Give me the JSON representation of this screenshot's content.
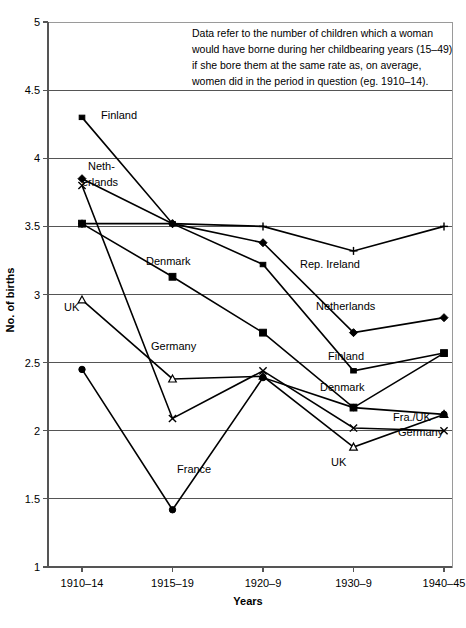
{
  "chart_data": {
    "type": "line",
    "title": "",
    "xlabel": "Years",
    "ylabel": "No. of births",
    "categories": [
      "1910–14",
      "1915–19",
      "1920–9",
      "1930–9",
      "1940–45"
    ],
    "ylim": [
      1,
      5
    ],
    "ytick_labels": [
      "1",
      "1.5",
      "2",
      "2.5",
      "3",
      "3.5",
      "4",
      "4.5",
      "5"
    ],
    "ytick_values": [
      1,
      1.5,
      2,
      2.5,
      3,
      3.5,
      4,
      4.5,
      5
    ],
    "grid": "horizontal",
    "legend": "inline-labels",
    "annotation": {
      "lines": [
        "Data refer to the number of children which a woman",
        "would have borne during her childbearing years (15–49)",
        "if she bore them at the same rate as, on average,",
        "women did in the period in question (eg. 1910–14)."
      ]
    },
    "series": [
      {
        "name": "Finland",
        "marker": "square-small",
        "values": [
          4.3,
          3.52,
          3.22,
          2.44,
          2.57
        ],
        "start_label": "Finland",
        "end_label": "Finland"
      },
      {
        "name": "Netherlands",
        "marker": "diamond",
        "values": [
          3.85,
          3.52,
          3.38,
          2.72,
          2.83
        ],
        "start_label": "Neth-\u000berlands",
        "end_label": "Netherlands"
      },
      {
        "name": "Rep. Ireland",
        "marker": "plus",
        "values": [
          3.52,
          3.52,
          3.5,
          3.32,
          3.5
        ],
        "start_label": "",
        "end_label": "Rep. Ireland"
      },
      {
        "name": "Denmark",
        "marker": "square",
        "values": [
          3.52,
          3.13,
          2.72,
          2.17,
          2.57
        ],
        "start_label": "Denmark",
        "end_label": "Denmark"
      },
      {
        "name": "UK",
        "marker": "triangle",
        "values": [
          2.96,
          2.38,
          2.4,
          1.88,
          2.12
        ],
        "start_label": "UK",
        "end_label": "Fra./UK"
      },
      {
        "name": "Germany",
        "marker": "x",
        "values": [
          3.8,
          2.09,
          2.44,
          2.02,
          2.0
        ],
        "start_label": "Germany",
        "end_label": "Germany"
      },
      {
        "name": "France",
        "marker": "circle",
        "values": [
          2.45,
          1.42,
          2.39,
          2.17,
          2.12
        ],
        "start_label": "France",
        "end_label": "Fra./UK"
      }
    ],
    "inline_labels": [
      {
        "text": "Finland",
        "x": 101,
        "y": 119,
        "name": "label-finland-left"
      },
      {
        "text": "Neth-",
        "x": 88,
        "y": 170,
        "name": "label-netherlands-left-line1"
      },
      {
        "text": "erlands",
        "x": 82,
        "y": 186,
        "name": "label-netherlands-left-line2"
      },
      {
        "text": "Denmark",
        "x": 146,
        "y": 265,
        "name": "label-denmark-left"
      },
      {
        "text": "UK",
        "x": 64,
        "y": 311,
        "name": "label-uk-left"
      },
      {
        "text": "Germany",
        "x": 151,
        "y": 350,
        "name": "label-germany-left"
      },
      {
        "text": "France",
        "x": 177,
        "y": 473,
        "name": "label-france-left"
      },
      {
        "text": "Rep. Ireland",
        "x": 300,
        "y": 268,
        "name": "label-rep-ireland"
      },
      {
        "text": "Netherlands",
        "x": 316,
        "y": 310,
        "name": "label-netherlands-right"
      },
      {
        "text": "Finland",
        "x": 328,
        "y": 360,
        "name": "label-finland-right"
      },
      {
        "text": "Denmark",
        "x": 320,
        "y": 391,
        "name": "label-denmark-right"
      },
      {
        "text": "Fra./UK",
        "x": 393,
        "y": 421,
        "name": "label-fra-uk-right"
      },
      {
        "text": "Germany",
        "x": 398,
        "y": 436,
        "name": "label-germany-right"
      },
      {
        "text": "UK",
        "x": 331,
        "y": 466,
        "name": "label-uk-right"
      }
    ]
  }
}
